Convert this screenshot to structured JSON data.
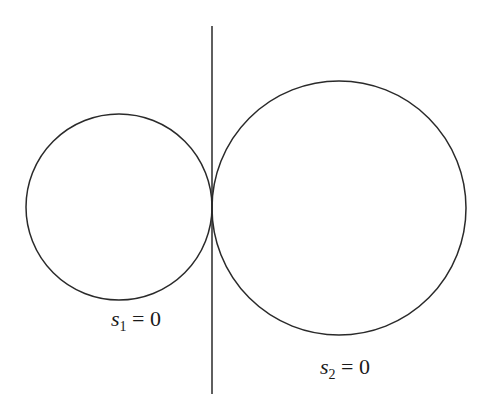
{
  "diagram": {
    "stroke_color": "#2a2a2a",
    "background": "#ffffff",
    "line": {
      "x": 212,
      "y1": 26,
      "y2": 394
    },
    "circles": [
      {
        "id": "circle-1",
        "cx": 119,
        "cy": 207,
        "r": 93
      },
      {
        "id": "circle-2",
        "cx": 339,
        "cy": 208,
        "r": 127
      }
    ],
    "labels": [
      {
        "var": "s",
        "sub": "1",
        "rest": " = 0"
      },
      {
        "var": "s",
        "sub": "2",
        "rest": " = 0"
      }
    ]
  }
}
